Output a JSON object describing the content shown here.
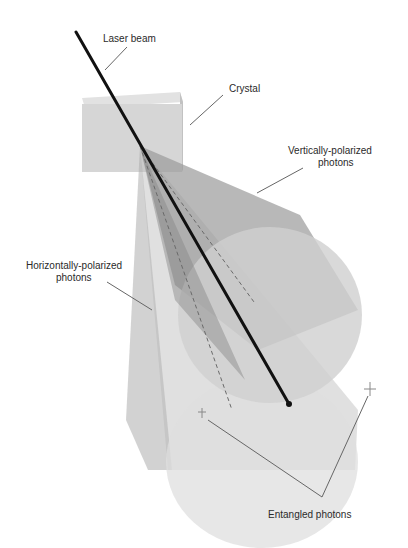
{
  "diagram": {
    "labels": {
      "laser_beam": "Laser beam",
      "crystal": "Crystal",
      "vertical_line1": "Vertically-polarized",
      "vertical_line2": "photons",
      "horizontal_line1": "Horizontally-polarized",
      "horizontal_line2": "photons",
      "entangled": "Entangled photons"
    },
    "colors": {
      "background": "#ffffff",
      "crystal_fill": "#d6d6d6",
      "crystal_edge": "#c4c4c4",
      "cone_dark": "#8c8c8c",
      "cone_light": "#c8c8c8",
      "beam": "#111111",
      "leader_line": "#666666",
      "text": "#2a2a2a"
    }
  }
}
